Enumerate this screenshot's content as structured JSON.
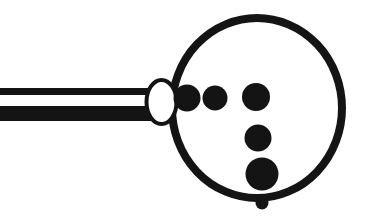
{
  "canvas": {
    "width": 376,
    "height": 216,
    "background_color": "#ffffff",
    "ink_color": "#141414"
  },
  "artwork": {
    "title": "Magnifier with dots",
    "style": "black-and-white line illustration",
    "stroke_color": "#141414",
    "fill_color": "#141414",
    "paper_color": "#ffffff"
  },
  "shapes": {
    "handle": {
      "name": "handle-bar",
      "type": "hollow-rectangle",
      "x": -6,
      "y": 88,
      "width": 166,
      "height": 33,
      "top_stripe_height": 7,
      "bottom_stripe_height": 15,
      "interior_color": "#ffffff",
      "stroke_color": "#141414"
    },
    "joint": {
      "name": "joint-ellipse",
      "type": "hollow-ellipse",
      "cx": 161.5,
      "cy": 102,
      "rx": 15,
      "ry": 22,
      "stroke_width": 4,
      "interior_color": "#ffffff",
      "stroke_color": "#141414"
    },
    "ring": {
      "name": "lens-ring",
      "type": "hollow-circle",
      "cx": 257,
      "cy": 108,
      "rx": 85,
      "ry": 90,
      "stroke_width": 8,
      "interior_color": "#ffffff",
      "stroke_color": "#141414"
    },
    "dots": [
      {
        "name": "dot-1",
        "cx": 187,
        "cy": 98,
        "r": 13.5,
        "fill": "#141414"
      },
      {
        "name": "dot-2",
        "cx": 215,
        "cy": 98,
        "r": 12.5,
        "fill": "#141414"
      },
      {
        "name": "dot-3",
        "cx": 256,
        "cy": 97,
        "r": 14.0,
        "fill": "#141414"
      },
      {
        "name": "dot-4",
        "cx": 258,
        "cy": 138,
        "r": 13.5,
        "fill": "#141414"
      },
      {
        "name": "dot-5",
        "cx": 262,
        "cy": 174,
        "r": 16.5,
        "fill": "#141414"
      },
      {
        "name": "dot-6",
        "cx": 262,
        "cy": 203,
        "r": 6.5,
        "fill": "#141414"
      }
    ]
  },
  "caption": {
    "alt_text": "Magnifier with dots"
  }
}
